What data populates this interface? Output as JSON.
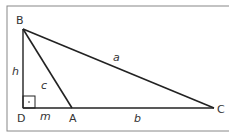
{
  "diagram": {
    "vertices": {
      "B": "B",
      "D": "D",
      "A": "A",
      "C": "C"
    },
    "sides": {
      "a": "a",
      "b": "b",
      "c": "c",
      "h": "h",
      "m": "m"
    },
    "right_angle_marker": "·",
    "colors": {
      "line": "#222222",
      "frame": "#777777",
      "text": "#333333"
    }
  }
}
